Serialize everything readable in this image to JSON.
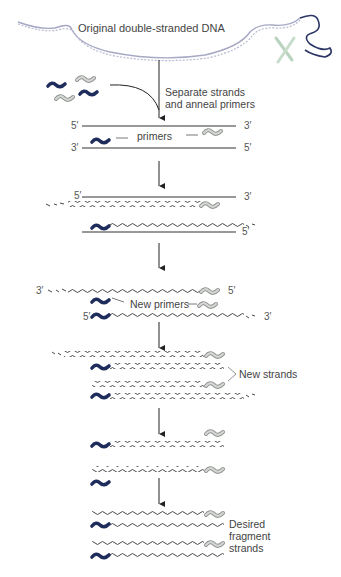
{
  "title": "Original double-stranded DNA",
  "steps": {
    "step1_label_line1": "Separate strands",
    "step1_label_line2": "and anneal primers",
    "primers_label": "primers",
    "new_primers_label": "New primers",
    "new_strands_label": "New strands",
    "desired_line1": "Desired",
    "desired_line2": "fragment",
    "desired_line3": "strands"
  },
  "ends": {
    "five_prime": "5′",
    "three_prime": "3′"
  },
  "colors": {
    "primer_dark": "#1f2d5c",
    "primer_light": "#b8bdb8",
    "strand": "#333333",
    "helix": "#a6a8c4",
    "chromosome": "#b9d3be"
  }
}
